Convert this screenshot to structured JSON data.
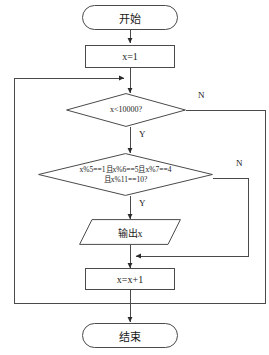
{
  "diagram": {
    "type": "flowchart",
    "orientation": "top-to-bottom",
    "colors": {
      "stroke": "#4a4a4a",
      "text": "#1a1a1a",
      "background": "#ffffff"
    },
    "nodes": [
      {
        "id": "start",
        "shape": "terminal",
        "label": "开始"
      },
      {
        "id": "init",
        "shape": "process",
        "label": "x=1"
      },
      {
        "id": "cond1",
        "shape": "decision",
        "label": "x<10000?"
      },
      {
        "id": "cond2",
        "shape": "decision",
        "label_line1": "x%5==1且x%6==5且x%7==4",
        "label_line2": "且x%11==10?"
      },
      {
        "id": "output",
        "shape": "io",
        "label": "输出x"
      },
      {
        "id": "incr",
        "shape": "process",
        "label": "x=x+1"
      },
      {
        "id": "end",
        "shape": "terminal",
        "label": "结束"
      }
    ],
    "edge_labels": {
      "cond1_no": "N",
      "cond1_yes": "Y",
      "cond2_no": "N",
      "cond2_yes": "Y"
    }
  }
}
